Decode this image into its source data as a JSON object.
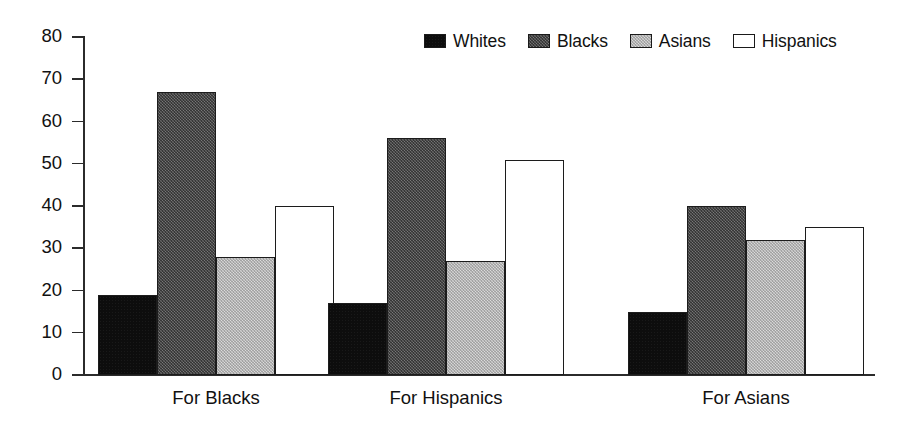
{
  "chart_data": {
    "type": "bar",
    "title": "",
    "subtitle": "",
    "xlabel": "",
    "ylabel": "",
    "categories": [
      "For Blacks",
      "For Hispanics",
      "For Asians"
    ],
    "series": [
      {
        "name": "Whites",
        "values": [
          19,
          17,
          15
        ],
        "color": "#0d0d0d",
        "swatch": "solid-black"
      },
      {
        "name": "Blacks",
        "values": [
          67,
          56,
          40
        ],
        "color": "#5a5a5a",
        "swatch": "dark-gray-texture"
      },
      {
        "name": "Asians",
        "values": [
          28,
          27,
          32
        ],
        "color": "#c9c9c9",
        "swatch": "light-gray-texture"
      },
      {
        "name": "Hispanics",
        "values": [
          40,
          51,
          35
        ],
        "color": "#ffffff",
        "swatch": "white-outline"
      }
    ],
    "ylim": [
      0,
      80
    ],
    "yticks": [
      0,
      10,
      20,
      30,
      40,
      50,
      60,
      70,
      80
    ],
    "ytick_labels": [
      "0",
      "10",
      "20",
      "30",
      "40",
      "50",
      "60",
      "70",
      "80"
    ],
    "grid": false,
    "legend_position": "top-right",
    "axis_color": "#2b2b2b",
    "background": "#ffffff"
  },
  "legend": {
    "entries": [
      {
        "label": "Whites"
      },
      {
        "label": "Blacks"
      },
      {
        "label": "Asians"
      },
      {
        "label": "Hispanics"
      }
    ]
  }
}
